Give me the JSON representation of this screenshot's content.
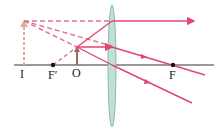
{
  "diagram": {
    "labels": {
      "image": "I",
      "focal_left": "F′",
      "object": "O",
      "focal_right": "F"
    },
    "colors": {
      "ray": "#e2456f",
      "ray_dashed": "#e2708f",
      "axis": "#333333",
      "lens_fill": "#bfe0d8",
      "lens_stroke": "#7fa8a0",
      "object_arrow": "#a0685a",
      "image_arrow": "#d9b0a0"
    }
  }
}
